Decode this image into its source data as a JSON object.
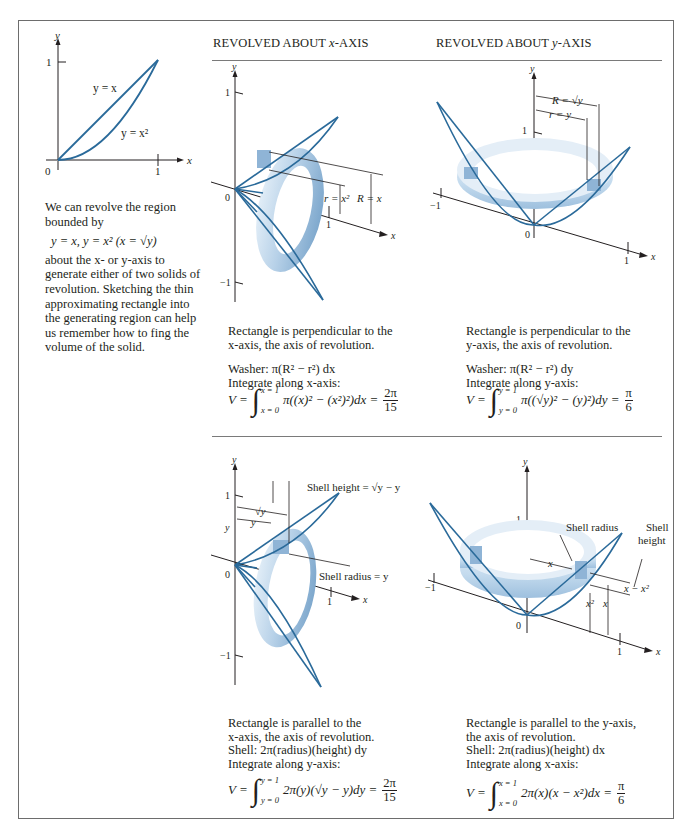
{
  "headers": {
    "x_axis": "REVOLVED ABOUT x-AXIS",
    "x_axis_prefix": "REVOLVED ABOUT ",
    "x_axis_var": "x",
    "x_axis_suffix": "-AXIS",
    "y_axis": "REVOLVED ABOUT y-AXIS",
    "y_axis_prefix": "REVOLVED ABOUT ",
    "y_axis_var": "y",
    "y_axis_suffix": "-AXIS"
  },
  "region_plot": {
    "axis_x": "x",
    "axis_y": "y",
    "tick_x": "1",
    "tick_y": "1",
    "origin": "0",
    "curve_line_label": "y = x",
    "curve_parabola_label": "y = x²"
  },
  "intro": {
    "line1": "We can revolve the region bounded by",
    "equation": "y = x,  y = x² (x = √y)",
    "line2": "about the x- or y-axis to generate either of two solids of revolution.  Sketching the thin approximating rectangle into the generating region can help us remember how to fing the volume of the solid."
  },
  "panels": {
    "washer_x": {
      "labels": {
        "axis_y": "y",
        "axis_x": "x",
        "tick_pos": "1",
        "tick_neg": "−1",
        "origin": "0",
        "tick_x": "1",
        "r": "r = x²",
        "R": "R = x"
      },
      "caption1": "Rectangle is perpendicular to the",
      "caption2": "x-axis, the axis of revolution.",
      "method": "Washer: π(R² − r²) dx",
      "integrate": "Integrate along x-axis:",
      "formula": {
        "lhs": "V =",
        "upper": "x = 1",
        "lower": "x = 0",
        "integrand": "π((x)² − (x²)²)dx =",
        "num": "2π",
        "den": "15"
      }
    },
    "washer_y": {
      "labels": {
        "axis_y": "y",
        "axis_x": "x",
        "tick_pos": "1",
        "tick_neg": "−1",
        "origin": "0",
        "tick_x": "1",
        "R": "R = √y",
        "r": "r = y"
      },
      "caption1": "Rectangle is perpendicular to the",
      "caption2": "y-axis, the axis of revolution.",
      "method": "Washer: π(R² − r²) dy",
      "integrate": "Integrate along y-axis:",
      "formula": {
        "lhs": "V =",
        "upper": "y = 1",
        "lower": "y = 0",
        "integrand": "π((√y)² − (y)²)dy =",
        "num": "π",
        "den": "6"
      }
    },
    "shell_x": {
      "labels": {
        "axis_y": "y",
        "axis_x": "x",
        "tick_pos": "1",
        "tick_neg": "−1",
        "origin": "0",
        "tick_x": "1",
        "tick_y": "y",
        "sqrt_y": "√y",
        "y": "y",
        "shell_height": "Shell height = √y − y",
        "shell_radius": "Shell radius = y"
      },
      "caption1": "Rectangle is parallel to the",
      "caption2": "x-axis, the axis of revolution.",
      "method": "Shell: 2π(radius)(height) dy",
      "integrate": "Integrate along y-axis:",
      "formula": {
        "lhs": "V =",
        "upper": "y = 1",
        "lower": "y = 0",
        "integrand": "2π(y)(√y − y)dy =",
        "num": "2π",
        "den": "15"
      }
    },
    "shell_y": {
      "labels": {
        "axis_y": "y",
        "axis_x": "x",
        "tick_pos": "1",
        "tick_neg": "−1",
        "origin": "0",
        "tick_x": "1",
        "shell_radius": "Shell radius",
        "shell_height_1": "Shell",
        "shell_height_2": "height",
        "x": "x",
        "x2": "x²",
        "xh": "x",
        "diff": "x − x²"
      },
      "caption1": "Rectangle is parallel to the y-axis,",
      "caption2": "the axis of revolution.",
      "method": "Shell: 2π(radius)(height) dx",
      "integrate": "Integrate along x-axis:",
      "formula": {
        "lhs": "V =",
        "upper": "x = 1",
        "lower": "x = 0",
        "integrand": "2π(x)(x − x²)dx =",
        "num": "π",
        "den": "6"
      }
    }
  },
  "colors": {
    "curve": "#2a6a9a",
    "solid_light": "#dbe9f5",
    "solid_mid": "#a9c8e2",
    "solid_dark": "#6f9cc4",
    "frame": "#6d6d6d",
    "text": "#231f20"
  }
}
